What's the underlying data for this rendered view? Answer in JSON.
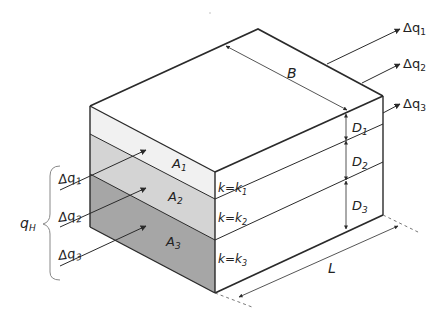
{
  "diagram": {
    "dimensions": {
      "width": "B",
      "length": "L"
    },
    "layers": [
      {
        "area": "A",
        "area_sub": "1",
        "k_label": "k=k",
        "k_sub": "1",
        "thickness": "D",
        "thickness_sub": "1",
        "color": "#f1f1f1"
      },
      {
        "area": "A",
        "area_sub": "2",
        "k_label": "k=k",
        "k_sub": "2",
        "thickness": "D",
        "thickness_sub": "2",
        "color": "#d4d4d4"
      },
      {
        "area": "A",
        "area_sub": "3",
        "k_label": "k=k",
        "k_sub": "3",
        "thickness": "D",
        "thickness_sub": "3",
        "color": "#a6a6a6"
      }
    ],
    "inflows": [
      {
        "label": "Δq",
        "sub": "1"
      },
      {
        "label": "Δq",
        "sub": "2"
      },
      {
        "label": "Δq",
        "sub": "3"
      }
    ],
    "outflows": [
      {
        "label": "Δq",
        "sub": "1"
      },
      {
        "label": "Δq",
        "sub": "2"
      },
      {
        "label": "Δq",
        "sub": "3"
      }
    ],
    "total_flow": {
      "label": "q",
      "sub": "H"
    },
    "line_color": "#2a2a2a"
  }
}
